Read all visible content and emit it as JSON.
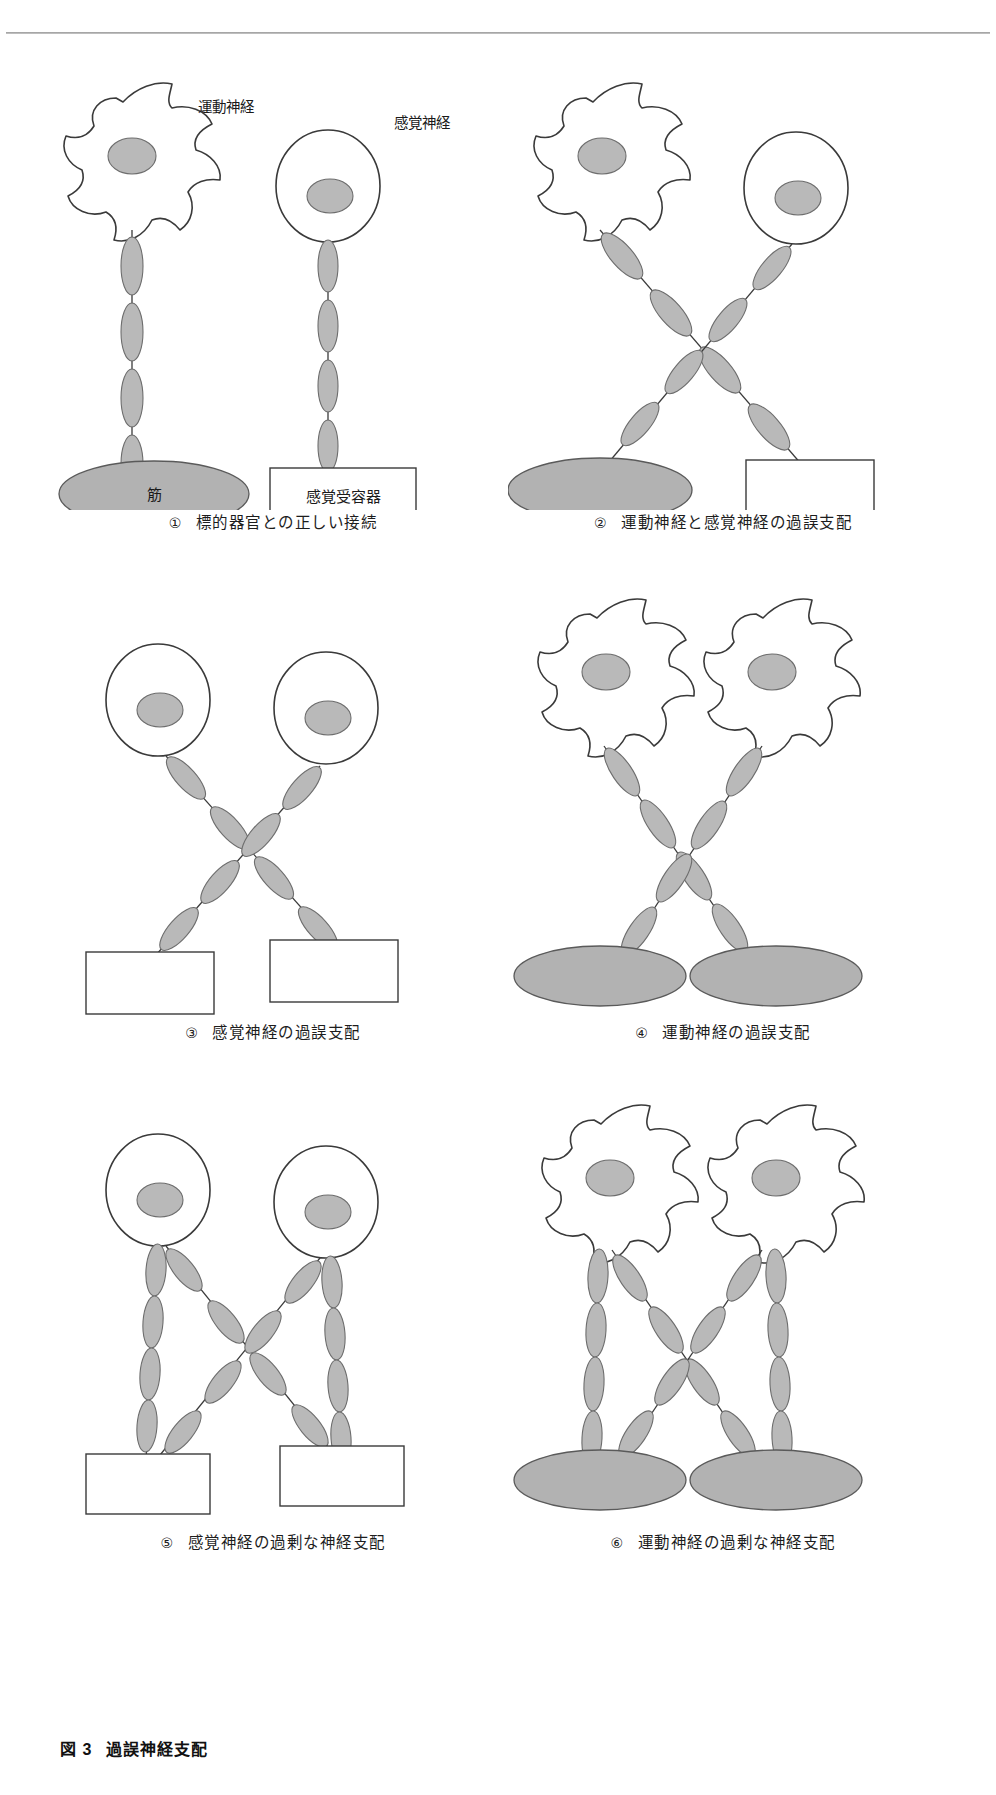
{
  "figure": {
    "title_number": "図 3",
    "title_text": "過誤神経支配",
    "colors": {
      "outline": "#3a3a3a",
      "nucleus_fill": "#b9b9b9",
      "axon_fill": "#b9b9b9",
      "muscle_fill": "#b2b2b2",
      "receptor_fill": "#ffffff",
      "background": "#ffffff",
      "rule": "#9b9b9b"
    }
  },
  "labels": {
    "motor_nerve": "運動神経",
    "sensory_nerve": "感覚神経",
    "muscle": "筋",
    "sensory_receptor": "感覚受容器"
  },
  "panels": [
    {
      "id": 1,
      "number": "①",
      "caption": "標的器官との正しい接続",
      "cells": [
        {
          "type": "motor-neuron",
          "label": "運動神経"
        },
        {
          "type": "sensory-neuron",
          "label": "感覚神経"
        }
      ],
      "targets": [
        {
          "type": "muscle",
          "label": "筋"
        },
        {
          "type": "receptor",
          "label": "感覚受容器"
        }
      ],
      "connections": "correct"
    },
    {
      "id": 2,
      "number": "②",
      "caption": "運動神経と感覚神経の過誤支配",
      "cells": [
        {
          "type": "motor-neuron",
          "label": ""
        },
        {
          "type": "sensory-neuron",
          "label": ""
        }
      ],
      "targets": [
        {
          "type": "muscle",
          "label": ""
        },
        {
          "type": "receptor",
          "label": ""
        }
      ],
      "connections": "crossed"
    },
    {
      "id": 3,
      "number": "③",
      "caption": "感覚神経の過誤支配",
      "cells": [
        {
          "type": "sensory-neuron",
          "label": ""
        },
        {
          "type": "sensory-neuron",
          "label": ""
        }
      ],
      "targets": [
        {
          "type": "receptor",
          "label": ""
        },
        {
          "type": "receptor",
          "label": ""
        }
      ],
      "connections": "crossed"
    },
    {
      "id": 4,
      "number": "④",
      "caption": "運動神経の過誤支配",
      "cells": [
        {
          "type": "motor-neuron",
          "label": ""
        },
        {
          "type": "motor-neuron",
          "label": ""
        }
      ],
      "targets": [
        {
          "type": "muscle",
          "label": ""
        },
        {
          "type": "muscle",
          "label": ""
        }
      ],
      "connections": "crossed"
    },
    {
      "id": 5,
      "number": "⑤",
      "caption": "感覚神経の過剰な神経支配",
      "cells": [
        {
          "type": "sensory-neuron",
          "label": ""
        },
        {
          "type": "sensory-neuron",
          "label": ""
        }
      ],
      "targets": [
        {
          "type": "receptor",
          "label": ""
        },
        {
          "type": "receptor",
          "label": ""
        }
      ],
      "connections": "hyperinnervation"
    },
    {
      "id": 6,
      "number": "⑥",
      "caption": "運動神経の過剰な神経支配",
      "cells": [
        {
          "type": "motor-neuron",
          "label": ""
        },
        {
          "type": "motor-neuron",
          "label": ""
        }
      ],
      "targets": [
        {
          "type": "muscle",
          "label": ""
        },
        {
          "type": "muscle",
          "label": ""
        }
      ],
      "connections": "hyperinnervation"
    }
  ]
}
